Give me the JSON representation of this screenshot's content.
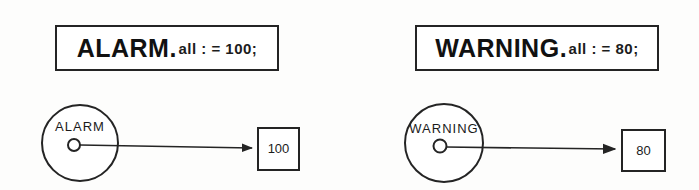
{
  "canvas": {
    "width": 699,
    "height": 190,
    "background": "#fdfdfc",
    "ink": "#242424"
  },
  "panels": [
    {
      "id": "alarm",
      "declaration": {
        "name": "ALARM",
        "separator": ".",
        "rest": "all : = 100;",
        "member": "all",
        "operator": ": =",
        "value": "100",
        "terminator": ";"
      },
      "node": {
        "label": "ALARM",
        "port_label": "output-port"
      },
      "target": {
        "value": "100"
      }
    },
    {
      "id": "warning",
      "declaration": {
        "name": "WARNING",
        "separator": ".",
        "rest": "all : = 80;",
        "member": "all",
        "operator": ": =",
        "value": "80",
        "terminator": ";"
      },
      "node": {
        "label": "WARNING",
        "port_label": "output-port"
      },
      "target": {
        "value": "80"
      }
    }
  ]
}
